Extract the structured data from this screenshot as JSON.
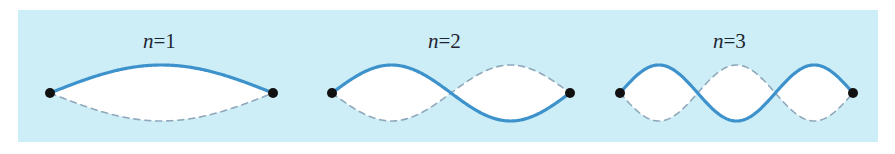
{
  "figure": {
    "panel_color": "#cdeef7",
    "page_background": "#ffffff",
    "solid_curve_color": "#3d92cc",
    "dashed_curve_color": "#8fa8bb",
    "lobe_fill_color": "#ffffff",
    "endpoint_color": "#111111"
  },
  "modes": [
    {
      "id": "mode-n1",
      "label_variable": "n",
      "label_equals": "=",
      "label_value": "1",
      "label_text": "n=1",
      "harmonic": 1,
      "antinodes": 1,
      "interior_nodes": 0,
      "x_start": 50,
      "x_end": 273,
      "axis_y": 93,
      "amplitude": 28,
      "label_x": 143,
      "label_y": 29
    },
    {
      "id": "mode-n2",
      "label_variable": "n",
      "label_equals": "=",
      "label_value": "2",
      "label_text": "n=2",
      "harmonic": 2,
      "antinodes": 2,
      "interior_nodes": 1,
      "x_start": 332,
      "x_end": 570,
      "axis_y": 93,
      "amplitude": 28,
      "label_x": 428,
      "label_y": 29
    },
    {
      "id": "mode-n3",
      "label_variable": "n",
      "label_equals": "=",
      "label_value": "3",
      "label_text": "n=3",
      "harmonic": 3,
      "antinodes": 3,
      "interior_nodes": 2,
      "x_start": 620,
      "x_end": 853,
      "axis_y": 93,
      "amplitude": 28,
      "label_x": 713,
      "label_y": 29
    }
  ],
  "chart_data": {
    "type": "line",
    "xlabel": "",
    "ylabel": "",
    "grid": false,
    "legend": "none",
    "series": [
      {
        "name": "n=1 solid (positive phase)",
        "style": "solid",
        "color": "#3d92cc",
        "formula": "y = A sin(1*pi*x/L)",
        "x_normalized": [
          0.0,
          0.125,
          0.25,
          0.375,
          0.5,
          0.625,
          0.75,
          0.875,
          1.0
        ],
        "y_normalized": [
          0.0,
          0.383,
          0.707,
          0.924,
          1.0,
          0.924,
          0.707,
          0.383,
          0.0
        ]
      },
      {
        "name": "n=1 dashed (negative phase)",
        "style": "dashed",
        "color": "#8fa8bb",
        "formula": "y = -A sin(1*pi*x/L)",
        "x_normalized": [
          0.0,
          0.125,
          0.25,
          0.375,
          0.5,
          0.625,
          0.75,
          0.875,
          1.0
        ],
        "y_normalized": [
          0.0,
          -0.383,
          -0.707,
          -0.924,
          -1.0,
          -0.924,
          -0.707,
          -0.383,
          0.0
        ]
      },
      {
        "name": "n=2 solid (positive phase)",
        "style": "solid",
        "color": "#3d92cc",
        "formula": "y = A sin(2*pi*x/L)",
        "x_normalized": [
          0.0,
          0.125,
          0.25,
          0.375,
          0.5,
          0.625,
          0.75,
          0.875,
          1.0
        ],
        "y_normalized": [
          0.0,
          0.707,
          1.0,
          0.707,
          0.0,
          -0.707,
          -1.0,
          -0.707,
          0.0
        ]
      },
      {
        "name": "n=2 dashed (negative phase)",
        "style": "dashed",
        "color": "#8fa8bb",
        "formula": "y = -A sin(2*pi*x/L)",
        "x_normalized": [
          0.0,
          0.125,
          0.25,
          0.375,
          0.5,
          0.625,
          0.75,
          0.875,
          1.0
        ],
        "y_normalized": [
          0.0,
          -0.707,
          -1.0,
          -0.707,
          0.0,
          0.707,
          1.0,
          0.707,
          0.0
        ]
      },
      {
        "name": "n=3 solid (positive phase)",
        "style": "solid",
        "color": "#3d92cc",
        "formula": "y = A sin(3*pi*x/L)",
        "x_normalized": [
          0.0,
          0.0833,
          0.1667,
          0.3333,
          0.5,
          0.6667,
          0.8333,
          0.9167,
          1.0
        ],
        "y_normalized": [
          0.0,
          0.707,
          1.0,
          0.0,
          -1.0,
          0.0,
          1.0,
          0.707,
          0.0
        ]
      },
      {
        "name": "n=3 dashed (negative phase)",
        "style": "dashed",
        "color": "#8fa8bb",
        "formula": "y = -A sin(3*pi*x/L)",
        "x_normalized": [
          0.0,
          0.0833,
          0.1667,
          0.3333,
          0.5,
          0.6667,
          0.8333,
          0.9167,
          1.0
        ],
        "y_normalized": [
          0.0,
          -0.707,
          -1.0,
          0.0,
          1.0,
          0.0,
          -1.0,
          -0.707,
          0.0
        ]
      }
    ],
    "annotations": [
      "n=1",
      "n=2",
      "n=3"
    ],
    "xlim": [
      0,
      1
    ],
    "ylim": [
      -1,
      1
    ]
  }
}
